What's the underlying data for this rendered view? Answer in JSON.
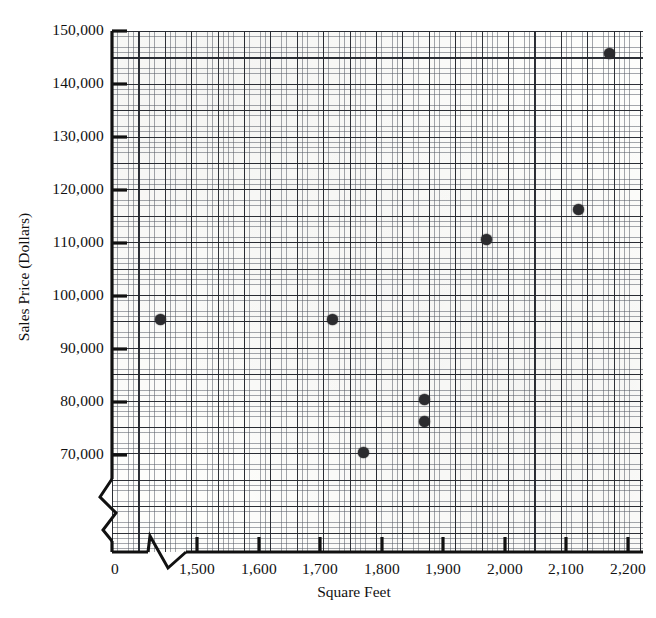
{
  "chart_data": {
    "type": "scatter",
    "title": "",
    "xlabel": "Square Feet",
    "ylabel": "Sales Price (Dollars)",
    "xlim": [
      1430,
      2290
    ],
    "ylim": [
      63000,
      150000
    ],
    "grid": true,
    "legend": "none",
    "axis_breaks": {
      "x": true,
      "y": true,
      "note": "Both axes show a zig-zag break between the origin and the first labeled tick"
    },
    "x_tick_labels": [
      "0",
      "1,500",
      "1,600",
      "1,700",
      "1,800",
      "1,900",
      "2,000",
      "2,100",
      "2,200"
    ],
    "y_tick_labels": [
      "70,000",
      "80,000",
      "90,000",
      "100,000",
      "110,000",
      "120,000",
      "130,000",
      "140,000",
      "150,000"
    ],
    "x": [
      1440,
      1720,
      1770,
      1870,
      1870,
      1970,
      2120,
      2170
    ],
    "y": [
      95500,
      95500,
      70500,
      80500,
      76300,
      110700,
      116400,
      145700
    ],
    "points": [
      {
        "x": 1440,
        "y": 95500
      },
      {
        "x": 1720,
        "y": 95500
      },
      {
        "x": 1770,
        "y": 70500
      },
      {
        "x": 1870,
        "y": 80500
      },
      {
        "x": 1870,
        "y": 76300
      },
      {
        "x": 1970,
        "y": 110700
      },
      {
        "x": 2120,
        "y": 116400
      },
      {
        "x": 2170,
        "y": 145700
      }
    ],
    "marker": {
      "shape": "circle",
      "color": "#2b2b2e",
      "size": 11
    },
    "colors": {
      "marker": "#2b2b2e",
      "grid_fine": "#5a5f69",
      "grid_coarse": "#23262d",
      "axis": "#111111"
    }
  },
  "axis": {
    "y_ticks": [
      {
        "label": "150,000",
        "value": 150000,
        "py": 31
      },
      {
        "label": "140,000",
        "value": 140000,
        "py": 84
      },
      {
        "label": "130,000",
        "value": 130000,
        "py": 137
      },
      {
        "label": "120,000",
        "value": 120000,
        "py": 190
      },
      {
        "label": "110,000",
        "value": 110000,
        "py": 243
      },
      {
        "label": "100,000",
        "value": 100000,
        "py": 296
      },
      {
        "label": "90,000",
        "value": 90000,
        "py": 349
      },
      {
        "label": "80,000",
        "value": 80000,
        "py": 402
      },
      {
        "label": "70,000",
        "value": 70000,
        "py": 455
      }
    ],
    "x_ticks": [
      {
        "label": "0",
        "value": 0,
        "px": 115
      },
      {
        "label": "1,500",
        "value": 1500,
        "px": 197
      },
      {
        "label": "1,600",
        "value": 1600,
        "px": 259
      },
      {
        "label": "1,700",
        "value": 1700,
        "px": 320
      },
      {
        "label": "1,800",
        "value": 1800,
        "px": 382
      },
      {
        "label": "1,900",
        "value": 1900,
        "px": 443
      },
      {
        "label": "2,000",
        "value": 2000,
        "px": 505
      },
      {
        "label": "2,100",
        "value": 2100,
        "px": 566
      },
      {
        "label": "2,200",
        "value": 2200,
        "px": 628
      }
    ]
  }
}
